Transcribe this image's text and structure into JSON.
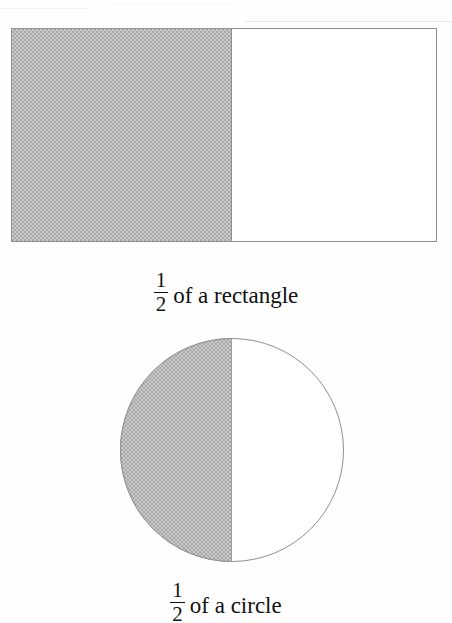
{
  "page": {
    "background_color": "#fefefe",
    "ink_color": "#111111",
    "shading_color": "#b8b8b8",
    "outline_color": "#8f8f8f"
  },
  "figures": [
    {
      "id": "rectangle",
      "shape": "rectangle",
      "shaded_portion": "left half",
      "fraction_numerator": "1",
      "fraction_denominator": "2",
      "caption_text": "of a rectangle",
      "caption_full": "1/2 of a rectangle"
    },
    {
      "id": "circle",
      "shape": "circle",
      "shaded_portion": "left half",
      "fraction_numerator": "1",
      "fraction_denominator": "2",
      "caption_text": "of a circle",
      "caption_full": "1/2 of a circle"
    }
  ]
}
